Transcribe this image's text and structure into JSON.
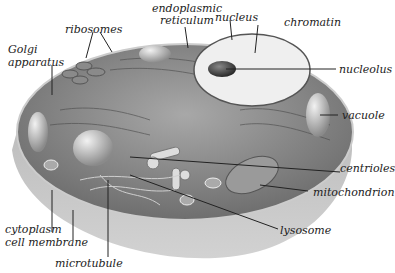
{
  "diagram": {
    "labels": {
      "endoplasmic_reticulum_1": "endoplasmic",
      "endoplasmic_reticulum_2": "reticulum",
      "nucleus": "nucleus",
      "chromatin": "chromatin",
      "ribosomes": "ribosomes",
      "golgi_1": "Golgi",
      "golgi_2": "apparatus",
      "nucleolus": "nucleolus",
      "vacuole": "vacuole",
      "centrioles": "centrioles",
      "mitochondrion": "mitochondrion",
      "lysosome": "lysosome",
      "cytoplasm": "cytoplasm",
      "cell_membrane": "cell membrane",
      "microtubule": "microtubule"
    }
  }
}
